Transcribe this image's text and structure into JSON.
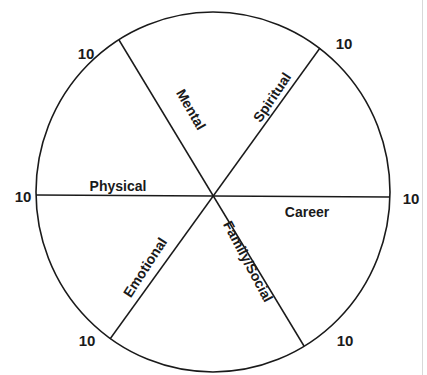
{
  "diagram": {
    "center": {
      "x": 212,
      "y": 196
    },
    "radius": 178,
    "stroke_color": "#1a1a1a",
    "segments": [
      {
        "label": "Mental",
        "x": 190,
        "y": 110,
        "rotate": 60
      },
      {
        "label": "Spiritual",
        "x": 273,
        "y": 98,
        "rotate": -56
      },
      {
        "label": "Physical",
        "x": 118,
        "y": 187,
        "rotate": 0
      },
      {
        "label": "Career",
        "x": 307,
        "y": 213,
        "rotate": 0
      },
      {
        "label": "Emotional",
        "x": 146,
        "y": 268,
        "rotate": -57
      },
      {
        "label": "Family/Social",
        "x": 247,
        "y": 262,
        "rotate": 62
      }
    ],
    "spoke_endpoints": [
      {
        "name": "mental",
        "x1": 119,
        "y1": 40,
        "x2": 304,
        "y2": 346
      },
      {
        "name": "spiritual",
        "x1": 320,
        "y1": 48,
        "x2": 110,
        "y2": 339
      },
      {
        "name": "horizontal",
        "x1": 36,
        "y1": 195,
        "x2": 390,
        "y2": 197
      }
    ],
    "scale_labels": [
      {
        "text": "10",
        "x": 86,
        "y": 55
      },
      {
        "text": "10",
        "x": 344,
        "y": 45
      },
      {
        "text": "10",
        "x": 23,
        "y": 198
      },
      {
        "text": "10",
        "x": 411,
        "y": 200
      },
      {
        "text": "10",
        "x": 87,
        "y": 342
      },
      {
        "text": "10",
        "x": 345,
        "y": 342
      }
    ]
  }
}
